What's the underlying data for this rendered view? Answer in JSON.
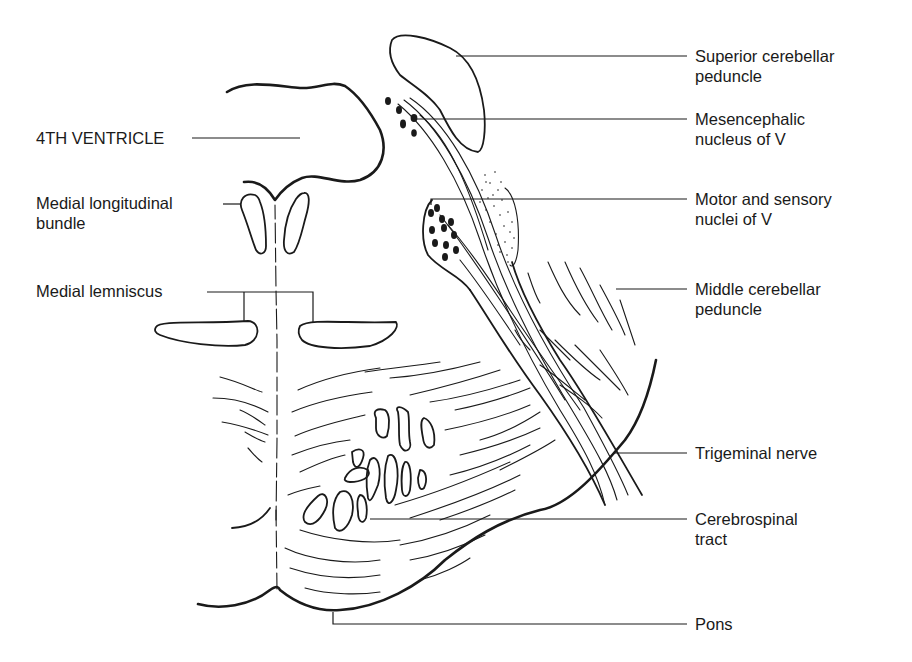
{
  "diagram": {
    "labels": {
      "fourth_ventricle": "4TH VENTRICLE",
      "mlf_line1": "Medial longitudinal",
      "mlf_line2": "bundle",
      "medial_lemniscus": "Medial lemniscus",
      "scp_line1": "Superior cerebellar",
      "scp_line2": "peduncle",
      "mesencephalic_line1": "Mesencephalic",
      "mesencephalic_line2": "nucleus of V",
      "motor_sensory_line1": "Motor and sensory",
      "motor_sensory_line2": "nuclei of V",
      "mcp_line1": "Middle cerebellar",
      "mcp_line2": "peduncle",
      "trigeminal": "Trigeminal nerve",
      "cerebrospinal_line1": "Cerebrospinal",
      "cerebrospinal_line2": "tract",
      "pons": "Pons"
    },
    "colors": {
      "ink": "#1a1a1a",
      "background": "#ffffff"
    }
  }
}
